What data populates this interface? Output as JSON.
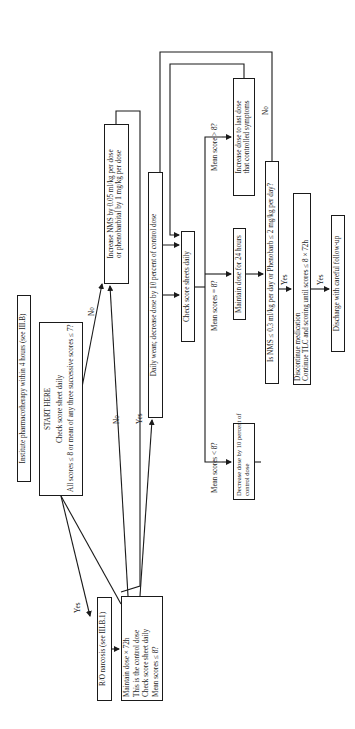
{
  "diagram": {
    "orientation": "rotated 90 degrees counter-clockwise",
    "nodes": {
      "institute": {
        "text": "Institute pharmacotherapy within 4 hours (see III.B)"
      },
      "start": {
        "lines": [
          "START HERE",
          "Check score sheet daily",
          "All scores ≤ 8 or mean of any three successive scores ≤ 7?"
        ]
      },
      "ro_narcosis": {
        "text": "R/O narcosis (see III.B.1)"
      },
      "maintain_control": {
        "lines": [
          "Maintain dose × 72h",
          "This is the control dose",
          "Check score sheet daily",
          "Mean scores ≤ 8?"
        ]
      },
      "increase_nms": {
        "lines": [
          "Increase NMS by 0.05 ml/kg per dose",
          "or phenobarbital by 1 mg/kg per dose"
        ]
      },
      "daily_wean": {
        "text": "Daily wean; decrease dose by 10 percent of control dose"
      },
      "check_sheets": {
        "text": "Check score sheets daily"
      },
      "decrease_dose": {
        "lines": [
          "Decrease dose by 10 percent of",
          "control dose"
        ]
      },
      "maintain_24": {
        "text": "Maintain dose for 24 hours"
      },
      "increase_last": {
        "lines": [
          "Increase dose to last dose",
          "that controlled symptoms"
        ]
      },
      "is_nms": {
        "text": "Is NMS ≤ 0.3 ml/kg per day or Phenobarb ≤ 2 mg/kg per day?"
      },
      "discontinue": {
        "lines": [
          "Discontinue medication",
          "Continue TLC and scoring until scores ≤ 8 × 72h"
        ]
      },
      "discharge": {
        "text": "Discharge with careful follow-up"
      }
    },
    "edge_labels": {
      "start_yes": "Yes",
      "start_no": "No",
      "maintain_no": "No",
      "maintain_yes": "Yes",
      "mean_lt": "Mean scores < 8?",
      "mean_eq": "Mean scores = 8?",
      "mean_gt": "Mean score > 8?",
      "is_nms_no": "No",
      "is_nms_yes": "Yes",
      "discontinue_yes": "Yes"
    }
  }
}
